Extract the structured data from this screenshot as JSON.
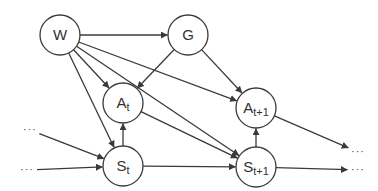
{
  "diagram": {
    "type": "directed-graph",
    "colors": {
      "stroke": "#3a3a3a",
      "fill": "#ffffff",
      "text": "#333333"
    },
    "nodes": [
      {
        "id": "W",
        "label": "W",
        "sub": "",
        "x": 60,
        "y": 35
      },
      {
        "id": "G",
        "label": "G",
        "sub": "",
        "x": 188,
        "y": 35
      },
      {
        "id": "At",
        "label": "A",
        "sub": "t",
        "x": 123,
        "y": 103
      },
      {
        "id": "At1",
        "label": "A",
        "sub": "t+1",
        "x": 256,
        "y": 108
      },
      {
        "id": "St",
        "label": "S",
        "sub": "t",
        "x": 123,
        "y": 166
      },
      {
        "id": "St1",
        "label": "S",
        "sub": "t+1",
        "x": 256,
        "y": 167
      }
    ],
    "ellipses": [
      {
        "id": "in-upper",
        "text": "···",
        "x": 30,
        "y": 130
      },
      {
        "id": "in-lower",
        "text": "···",
        "x": 27,
        "y": 170
      },
      {
        "id": "out-upper",
        "text": "···",
        "x": 358,
        "y": 152
      },
      {
        "id": "out-lower",
        "text": "···",
        "x": 358,
        "y": 170
      }
    ],
    "edges": [
      {
        "from": "W",
        "to": "G"
      },
      {
        "from": "W",
        "to": "At"
      },
      {
        "from": "W",
        "to": "St"
      },
      {
        "from": "W",
        "to": "At1"
      },
      {
        "from": "W",
        "to": "St1"
      },
      {
        "from": "G",
        "to": "At"
      },
      {
        "from": "G",
        "to": "At1"
      },
      {
        "from": "St",
        "to": "At"
      },
      {
        "from": "At",
        "to": "St1"
      },
      {
        "from": "St",
        "to": "St1"
      },
      {
        "from": "St1",
        "to": "At1"
      },
      {
        "from": "in-upper",
        "to": "St"
      },
      {
        "from": "in-lower",
        "to": "St"
      },
      {
        "from": "At1",
        "to": "out-upper"
      },
      {
        "from": "St1",
        "to": "out-lower"
      }
    ]
  }
}
